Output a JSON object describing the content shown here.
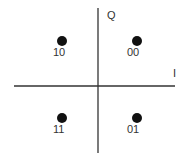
{
  "diagram": {
    "type": "constellation",
    "axes": {
      "in_phase_label": "I",
      "quadrature_label": "Q"
    },
    "points": [
      {
        "label": "10",
        "i": -1,
        "q": 1
      },
      {
        "label": "00",
        "i": 1,
        "q": 1
      },
      {
        "label": "11",
        "i": -1,
        "q": -1
      },
      {
        "label": "01",
        "i": 1,
        "q": -1
      }
    ],
    "colors": {
      "axis": "#333333",
      "point": "#111111",
      "text": "#333333"
    }
  }
}
